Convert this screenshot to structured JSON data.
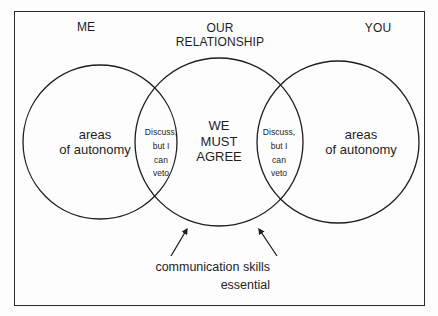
{
  "diagram": {
    "headings": {
      "left": "ME",
      "middle_line1": "OUR",
      "middle_line2": "RELATIONSHIP",
      "right": "YOU"
    },
    "circles": [
      {
        "id": "me",
        "cx": 100,
        "cy": 142,
        "r": 77,
        "label_line1": "areas",
        "label_line2": "of autonomy"
      },
      {
        "id": "our-relationship",
        "cx": 219,
        "cy": 142,
        "r": 84,
        "label_line1": "WE",
        "label_line2": "MUST",
        "label_line3": "AGREE"
      },
      {
        "id": "you",
        "cx": 338,
        "cy": 142,
        "r": 81,
        "label_line1": "areas",
        "label_line2": "of autonomy"
      }
    ],
    "overlaps": {
      "left": {
        "line1": "Discuss,",
        "line2": "but I",
        "line3": "can",
        "line4": "veto"
      },
      "right": {
        "line1": "Discuss,",
        "line2": "but I",
        "line3": "can",
        "line4": "veto"
      }
    },
    "caption": {
      "line1": "communication skills",
      "line2": "essential"
    },
    "colors": {
      "stroke": "#1e1e1e",
      "background": "#fdfdfd",
      "text": "#1e1e1e"
    }
  }
}
